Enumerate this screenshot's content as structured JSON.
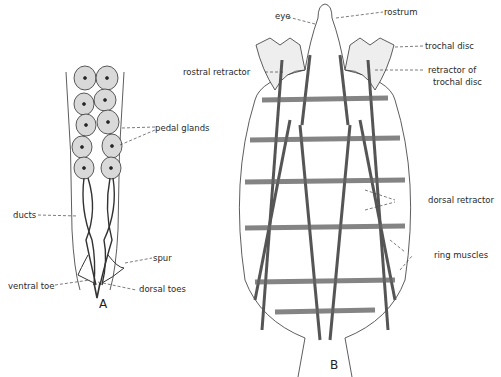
{
  "figure": {
    "panels": [
      {
        "id": "A",
        "letter": "A",
        "labels": {
          "pedal_glands": "pedal glands",
          "ducts": "ducts",
          "spur": "spur",
          "ventral_toe": "ventral toe",
          "dorsal_toes": "dorsal toes"
        }
      },
      {
        "id": "B",
        "letter": "B",
        "labels": {
          "eye": "eye",
          "rostrum": "rostrum",
          "trochal_disc": "trochal disc",
          "rostral_retractor": "rostral retractor",
          "retractor_of_trochal_disc_1": "retractor of",
          "retractor_of_trochal_disc_2": "trochal disc",
          "dorsal_retractor": "dorsal retractor",
          "ring_muscles": "ring muscles"
        }
      }
    ],
    "colors": {
      "ink": "#2a2a2a",
      "gland_fill": "#d8d8d8",
      "muscle": "#555555"
    }
  }
}
